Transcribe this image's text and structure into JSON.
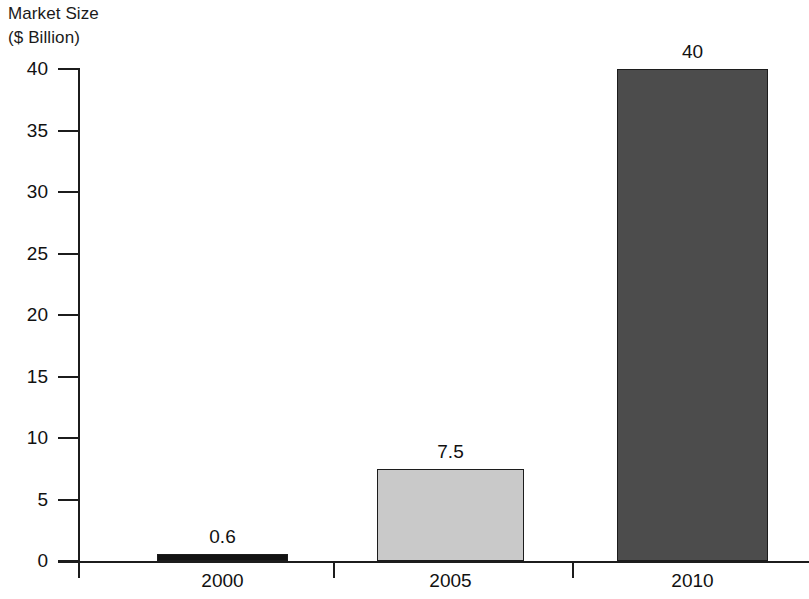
{
  "chart_data": {
    "type": "bar",
    "title": "",
    "subtitle": "",
    "ylabel_line1": "Market Size",
    "ylabel_line2": "($ Billion)",
    "xlabel": "",
    "categories": [
      "2000",
      "2005",
      "2010"
    ],
    "values": [
      0.6,
      7.5,
      40
    ],
    "value_labels": [
      "0.6",
      "7.5",
      "40"
    ],
    "series": [
      {
        "name": "Market Size",
        "values": [
          0.6,
          7.5,
          40
        ]
      }
    ],
    "ylim": [
      0,
      40
    ],
    "ytick_values": [
      0,
      5,
      10,
      15,
      20,
      25,
      30,
      35,
      40
    ],
    "ytick_labels": [
      "0",
      "5",
      "10",
      "15",
      "20",
      "25",
      "30",
      "35",
      "40"
    ],
    "grid": false,
    "legend": false,
    "legend_position": "none",
    "bar_colors": [
      "#121212",
      "#c9c9c9",
      "#4c4c4c"
    ],
    "bar_edge_color": "#1c1c1c",
    "axis_color": "#1c1c1c",
    "background_color": "#ffffff"
  }
}
